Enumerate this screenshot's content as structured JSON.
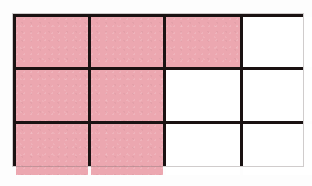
{
  "figure": {
    "kind": "area-model-grid",
    "title": "",
    "background_color": "#fdfdfd",
    "gridline_color": "#1a1212",
    "gridline_width_px": 3,
    "shaded_color": "#eca7b0",
    "unshaded_color": "#ffffff",
    "columns": 4,
    "rows": 3,
    "total_cells": 12,
    "shaded_cells": 7,
    "unshaded_cells": 5,
    "fraction_shaded": "7/12",
    "cells": [
      {
        "row": 1,
        "column": 1,
        "state": "shaded",
        "label": ""
      },
      {
        "row": 1,
        "column": 2,
        "state": "shaded",
        "label": ""
      },
      {
        "row": 1,
        "column": 3,
        "state": "shaded",
        "label": ""
      },
      {
        "row": 1,
        "column": 4,
        "state": "unshaded",
        "label": ""
      },
      {
        "row": 2,
        "column": 1,
        "state": "shaded",
        "label": ""
      },
      {
        "row": 2,
        "column": 2,
        "state": "shaded",
        "label": ""
      },
      {
        "row": 2,
        "column": 3,
        "state": "unshaded",
        "label": ""
      },
      {
        "row": 2,
        "column": 4,
        "state": "unshaded",
        "label": ""
      },
      {
        "row": 3,
        "column": 1,
        "state": "shaded",
        "label": ""
      },
      {
        "row": 3,
        "column": 2,
        "state": "shaded",
        "label": ""
      },
      {
        "row": 3,
        "column": 3,
        "state": "unshaded",
        "label": ""
      },
      {
        "row": 3,
        "column": 4,
        "state": "unshaded",
        "label": ""
      }
    ]
  }
}
